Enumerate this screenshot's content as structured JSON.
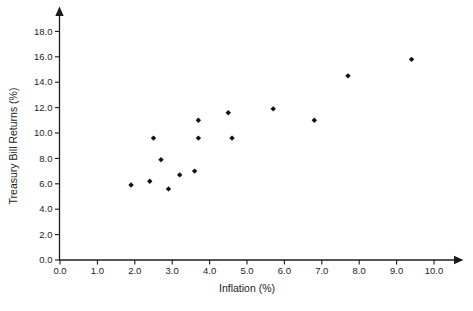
{
  "figure": {
    "background_color": "#ffffff",
    "axis_color": "#1c1c1c",
    "marker_color": "#111111",
    "marker_shape": "diamond"
  },
  "chart_data": {
    "type": "scatter",
    "title": "",
    "xlabel": "Inflation (%)",
    "ylabel": "Treasury Bill Returns (%)",
    "xlim": [
      0.0,
      10.0
    ],
    "ylim": [
      0.0,
      18.0
    ],
    "grid": false,
    "legend": "none",
    "x_tick_labels": [
      "0.0",
      "1.0",
      "2.0",
      "3.0",
      "4.0",
      "5.0",
      "6.0",
      "7.0",
      "8.0",
      "9.0",
      "10.0"
    ],
    "y_tick_labels": [
      "0.0",
      "2.0",
      "4.0",
      "6.0",
      "8.0",
      "10.0",
      "12.0",
      "14.0",
      "16.0",
      "18.0"
    ],
    "x_ticks": [
      0,
      1,
      2,
      3,
      4,
      5,
      6,
      7,
      8,
      9,
      10
    ],
    "y_ticks": [
      0,
      2,
      4,
      6,
      8,
      10,
      12,
      14,
      16,
      18
    ],
    "series": [
      {
        "name": "inflation-vs-tbill-returns",
        "points": [
          {
            "x": 1.9,
            "y": 5.9
          },
          {
            "x": 2.4,
            "y": 6.2
          },
          {
            "x": 2.5,
            "y": 9.6
          },
          {
            "x": 2.7,
            "y": 7.9
          },
          {
            "x": 2.9,
            "y": 5.6
          },
          {
            "x": 3.2,
            "y": 6.7
          },
          {
            "x": 3.6,
            "y": 7.0
          },
          {
            "x": 3.7,
            "y": 11.0
          },
          {
            "x": 3.7,
            "y": 9.6
          },
          {
            "x": 4.5,
            "y": 11.6
          },
          {
            "x": 4.6,
            "y": 9.6
          },
          {
            "x": 5.7,
            "y": 11.9
          },
          {
            "x": 6.8,
            "y": 11.0
          },
          {
            "x": 7.7,
            "y": 14.5
          },
          {
            "x": 9.4,
            "y": 15.8
          }
        ]
      }
    ]
  }
}
